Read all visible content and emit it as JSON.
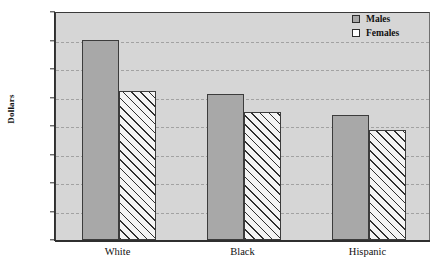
{
  "chart_data": {
    "type": "bar",
    "title": "",
    "xlabel": "",
    "ylabel": "Dollars",
    "ylim": [
      0,
      800
    ],
    "yticks": [
      0,
      100,
      200,
      300,
      400,
      500,
      600,
      700,
      800
    ],
    "ytick_labels": [
      "0",
      "100",
      "200",
      "300",
      "400",
      "500",
      "600",
      "700",
      "800"
    ],
    "grid": true,
    "legend_position": "top-right",
    "categories": [
      "White",
      "Black",
      "Hispanic"
    ],
    "series": [
      {
        "name": "Males",
        "values": [
          702,
          511,
          440
        ]
      },
      {
        "name": "Females",
        "values": [
          523,
          450,
          387
        ]
      }
    ]
  },
  "legend": {
    "items": [
      {
        "label": "Males",
        "swatch": "filled-gray-square"
      },
      {
        "label": "Females",
        "swatch": "white-square"
      }
    ]
  },
  "axis": {
    "y_title": "Dollars"
  },
  "colors": {
    "plot_background": "#d6d6d6",
    "male_bar_fill": "#a8a8a8",
    "female_bar_fill": "#f4f4f4",
    "bar_border": "#3c3c3c",
    "gridline": "#9a9a9a",
    "axis": "#2f2f2f",
    "page_background": "#ffffff"
  },
  "title_sliver": ""
}
